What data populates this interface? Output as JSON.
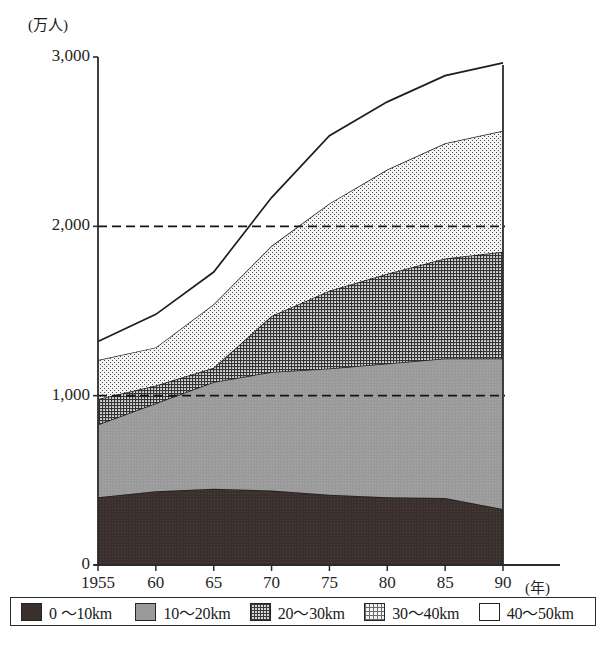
{
  "chart_data": {
    "type": "area",
    "stacked": true,
    "title": "",
    "subtitle": "",
    "xlabel": "(年)",
    "ylabel": "(万人)",
    "y_unit_caption": "(万人)",
    "x_unit_caption": "(年)",
    "grid": "horizontal-dashed",
    "legend_position": "bottom",
    "xlim": [
      1955,
      1990
    ],
    "ylim": [
      0,
      3000
    ],
    "yticks": [
      0,
      1000,
      2000,
      3000
    ],
    "ytick_labels": [
      "0",
      "1,000",
      "2,000",
      "3,000"
    ],
    "gridlines": [
      1000,
      2000
    ],
    "x": [
      1955,
      1960,
      1965,
      1970,
      1975,
      1980,
      1985,
      1990
    ],
    "xtick_labels": [
      "1955",
      "60",
      "65",
      "70",
      "75",
      "80",
      "85",
      "90"
    ],
    "categories": [
      "1955",
      "60",
      "65",
      "70",
      "75",
      "80",
      "85",
      "90"
    ],
    "series": [
      {
        "name": "0～10km",
        "key": "band_0_10",
        "color": "#3a2f2c",
        "pattern": "solid-dark",
        "values": [
          400,
          435,
          450,
          440,
          415,
          400,
          395,
          330
        ]
      },
      {
        "name": "10～20km",
        "key": "band_10_20",
        "color": "#9a9a9a",
        "pattern": "solid-mid-gray",
        "values": [
          430,
          520,
          630,
          700,
          745,
          790,
          825,
          890
        ]
      },
      {
        "name": "20～30km",
        "key": "band_20_30",
        "color": "#d6d6d6",
        "pattern": "dense-cross-hatch",
        "values": [
          150,
          105,
          85,
          330,
          460,
          530,
          590,
          630
        ]
      },
      {
        "name": "30～40km",
        "key": "band_30_40",
        "color": "#f2f2f2",
        "pattern": "fine-dot-hatch",
        "values": [
          230,
          225,
          375,
          415,
          515,
          615,
          680,
          715
        ]
      },
      {
        "name": "40～50km",
        "key": "band_40_50",
        "color": "#ffffff",
        "pattern": "blank",
        "values": [
          110,
          195,
          190,
          285,
          400,
          400,
          400,
          400
        ]
      }
    ],
    "cumulative_tops": {
      "band_0_10": [
        400,
        435,
        450,
        440,
        415,
        400,
        395,
        330
      ],
      "band_10_20": [
        830,
        955,
        1080,
        1140,
        1160,
        1190,
        1220,
        1220
      ],
      "band_20_30": [
        980,
        1060,
        1165,
        1470,
        1620,
        1720,
        1810,
        1850
      ],
      "band_30_40": [
        1210,
        1285,
        1540,
        1885,
        2135,
        2335,
        2490,
        2565
      ],
      "band_40_50": [
        1320,
        1480,
        1730,
        2170,
        2535,
        2735,
        2890,
        2965
      ]
    },
    "totals": [
      1320,
      1480,
      1730,
      2170,
      2535,
      2735,
      2890,
      2965
    ]
  },
  "legend": {
    "items": [
      {
        "label": "0 ～10km",
        "swatch": "sw-0"
      },
      {
        "label": "10～20km",
        "swatch": "sw-1"
      },
      {
        "label": "20～30km",
        "swatch": "sw-2"
      },
      {
        "label": "30～40km",
        "swatch": "sw-3"
      },
      {
        "label": "40～50km",
        "swatch": "sw-4"
      }
    ]
  },
  "axes": {
    "y_caption": "(万人)",
    "x_caption": "(年)",
    "ytick_labels": [
      "3,000",
      "2,000",
      "1,000",
      "0"
    ],
    "xtick_labels": [
      "1955",
      "60",
      "65",
      "70",
      "75",
      "80",
      "85",
      "90"
    ]
  },
  "colors": {
    "axis": "#2b2b2b",
    "grid": "#1f1f1f",
    "band_0_10": "#3a2f2c",
    "band_10_20": "#9a9a9a",
    "band_20_30": "#d6d6d6",
    "band_30_40": "#f2f2f2",
    "band_40_50": "#ffffff",
    "background": "#ffffff"
  }
}
